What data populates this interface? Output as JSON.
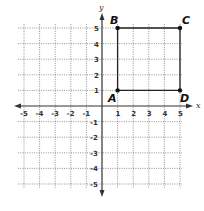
{
  "diagram": {
    "type": "coordinate-plane",
    "x_axis_label": "x",
    "y_axis_label": "y",
    "x_range": [
      -5,
      5
    ],
    "y_range": [
      -5,
      5
    ],
    "grid": "dotted",
    "x_ticks": [
      "-5",
      "-4",
      "-3",
      "-2",
      "-1",
      "1",
      "2",
      "3",
      "4",
      "5"
    ],
    "y_ticks": [
      "5",
      "4",
      "3",
      "2",
      "1",
      "-1",
      "-2",
      "-3",
      "-4",
      "-5"
    ],
    "points": [
      {
        "label": "A",
        "x": 1,
        "y": 1
      },
      {
        "label": "B",
        "x": 1,
        "y": 5
      },
      {
        "label": "C",
        "x": 5,
        "y": 5
      },
      {
        "label": "D",
        "x": 5,
        "y": 1
      }
    ],
    "shape": "rectangle ABCD"
  }
}
